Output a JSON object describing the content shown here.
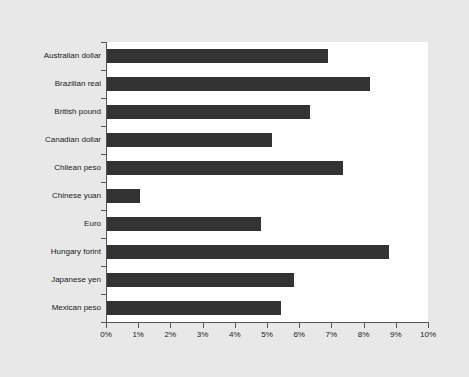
{
  "chart_data": {
    "type": "bar",
    "orientation": "horizontal",
    "title": "",
    "subtitle": "",
    "xlabel": "",
    "ylabel": "",
    "xlim": [
      0,
      10
    ],
    "ylim": null,
    "grid": false,
    "legend": null,
    "legend_position": "none",
    "x_tick_labels": [
      "0%",
      "1%",
      "2%",
      "3%",
      "4%",
      "5%",
      "6%",
      "7%",
      "8%",
      "9%",
      "10%"
    ],
    "x_tick_values": [
      0,
      1,
      2,
      3,
      4,
      5,
      6,
      7,
      8,
      9,
      10
    ],
    "unit": "%",
    "categories": [
      "Australian dollar",
      "Brazilian real",
      "British pound",
      "Canadian dollar",
      "Chilean peso",
      "Chinese yuan",
      "Euro",
      "Hungary forint",
      "Japanese yen",
      "Mexican peso"
    ],
    "values": [
      6.9,
      8.2,
      6.35,
      5.15,
      7.35,
      1.05,
      4.8,
      8.8,
      5.85,
      5.45
    ],
    "annotations": []
  },
  "style": {
    "bar_color": "#333333",
    "plot_background": "#ffffff",
    "page_background": "#e8e8e8",
    "axis_color": "#555555",
    "text_color": "#1a1a1a"
  }
}
